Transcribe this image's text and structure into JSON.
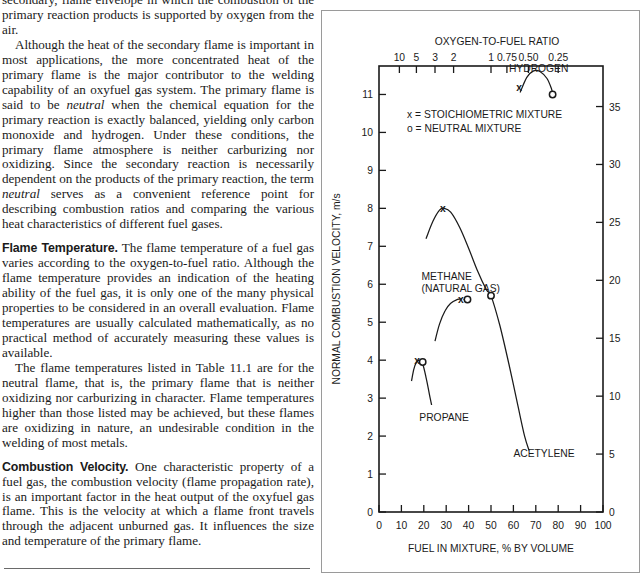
{
  "document": {
    "paragraphs": [
      {
        "id": "p0",
        "indent": false,
        "clipped": true,
        "runs": [
          {
            "t": "text",
            "v": "secondary, flame envelope in which the combustion of the primary reaction products is supported by oxygen from the air."
          }
        ]
      },
      {
        "id": "p1",
        "indent": true,
        "clipped": false,
        "runs": [
          {
            "t": "text",
            "v": "Although the heat of the secondary flame is important in most applications, the more concentrated heat of the primary flame is the major contributor to the welding capability of an oxyfuel gas system. The primary flame is said to be "
          },
          {
            "t": "ital",
            "v": "neutral"
          },
          {
            "t": "text",
            "v": " when the chemical equation for the primary reaction is exactly balanced, yielding only carbon monoxide and hydrogen. Under these conditions, the primary flame atmosphere is neither carburizing nor oxidizing. Since the secondary reaction is necessarily dependent on the products of the primary reaction, the term "
          },
          {
            "t": "ital",
            "v": "neutral"
          },
          {
            "t": "text",
            "v": " serves as a convenient reference point for describing combustion ratios and comparing the various heat characteristics of different fuel gases."
          }
        ]
      },
      {
        "id": "p2",
        "indent": false,
        "clipped": false,
        "runs": [
          {
            "t": "runin",
            "v": "Flame Temperature."
          },
          {
            "t": "text",
            "v": " The flame temperature of a fuel gas varies according to the oxygen-to-fuel ratio. Although the flame temperature provides an indication of the heating ability of the fuel gas, it is only one of the many physical properties to be considered in an overall evaluation. Flame temperatures are usually calculated mathematically, as no practical method of accurately measuring these values is available."
          }
        ]
      },
      {
        "id": "p3",
        "indent": true,
        "clipped": false,
        "runs": [
          {
            "t": "text",
            "v": "The flame temperatures listed in Table 11.1 are for the neutral flame, that is, the primary flame that is neither oxidizing nor carburizing in character. Flame temperatures higher than those listed may be achieved, but these flames are oxidizing in nature, an undesirable condition in the welding of most metals."
          }
        ]
      },
      {
        "id": "p4",
        "indent": false,
        "clipped": false,
        "runs": [
          {
            "t": "runin",
            "v": "Combustion Velocity."
          },
          {
            "t": "text",
            "v": " One characteristic property of a fuel gas, the combustion velocity (flame propagation rate), is an important factor in the heat output of the oxyfuel gas flame. This is the velocity at which a flame front travels through the adjacent unburned gas. It influences the size and temperature of the primary flame."
          }
        ]
      }
    ]
  },
  "chart_data": {
    "type": "line",
    "title": "",
    "xlabel": "FUEL IN MIXTURE, % BY VOLUME",
    "ylabel": "NORMAL COMBUSTION VELOCITY, m/s",
    "y2label": "NORMAL COMBUSTION VELOCITY, ft/s",
    "top_axis_label": "OXYGEN-TO-FUEL RATIO",
    "xlim": [
      0,
      100
    ],
    "ylim": [
      0,
      11.75
    ],
    "y2lim": [
      0,
      38.5
    ],
    "grid": false,
    "legend_position": "inside-top-left",
    "x_ticks": [
      0,
      10,
      20,
      30,
      40,
      50,
      60,
      70,
      80,
      90,
      100
    ],
    "x_tick_labels": [
      "0",
      "10",
      "20",
      "30",
      "40",
      "50",
      "60",
      "70",
      "80",
      "90",
      "100"
    ],
    "y_ticks": [
      0,
      1,
      2,
      3,
      4,
      5,
      6,
      7,
      8,
      9,
      10,
      11
    ],
    "y_tick_labels": [
      "0",
      "1",
      "2",
      "3",
      "4",
      "5",
      "6",
      "7",
      "8",
      "9",
      "10",
      "11"
    ],
    "y2_ticks": [
      0,
      5,
      10,
      15,
      20,
      25,
      30,
      35
    ],
    "y2_tick_labels": [
      "0",
      "5",
      "10",
      "15",
      "20",
      "25",
      "30",
      "35"
    ],
    "top_ticks": [
      {
        "label": "10",
        "x": 9.1
      },
      {
        "label": "5",
        "x": 16.7
      },
      {
        "label": "3",
        "x": 25.0
      },
      {
        "label": "2",
        "x": 33.3
      },
      {
        "label": "1",
        "x": 50.0
      },
      {
        "label": "0.75",
        "x": 57.1
      },
      {
        "label": "0.50",
        "x": 66.7
      },
      {
        "label": "0.25",
        "x": 80.0
      }
    ],
    "legend": [
      {
        "symbol": "x",
        "text": "x = STOICHIOMETRIC MIXTURE"
      },
      {
        "symbol": "o",
        "text": "o = NEUTRAL MIXTURE"
      }
    ],
    "series": [
      {
        "name": "HYDROGEN",
        "label_x": 58,
        "label_y": 11.6,
        "points": [
          [
            63,
            11.05
          ],
          [
            66,
            11.45
          ],
          [
            69,
            11.62
          ],
          [
            72,
            11.6
          ],
          [
            75,
            11.42
          ],
          [
            77,
            11.15
          ],
          [
            77.5,
            11.0
          ]
        ],
        "markers": [
          {
            "type": "x",
            "x": 62.5,
            "y": 11.2
          },
          {
            "type": "o",
            "x": 77.5,
            "y": 11.0
          }
        ]
      },
      {
        "name": "ACETYLENE",
        "label_x": 60,
        "label_y": 1.45,
        "points": [
          [
            21,
            7.2
          ],
          [
            24,
            7.65
          ],
          [
            27,
            7.95
          ],
          [
            29,
            8.0
          ],
          [
            32,
            7.9
          ],
          [
            36,
            7.5
          ],
          [
            40,
            6.95
          ],
          [
            44,
            6.35
          ],
          [
            48,
            5.85
          ],
          [
            50,
            5.7
          ],
          [
            54,
            4.9
          ],
          [
            58,
            3.9
          ],
          [
            62,
            2.8
          ],
          [
            65,
            2.0
          ],
          [
            67,
            1.62
          ]
        ],
        "markers": [
          {
            "type": "x",
            "x": 28.5,
            "y": 8.0
          },
          {
            "type": "o",
            "x": 50,
            "y": 5.7
          }
        ]
      },
      {
        "name": "METHANE (NATURAL GAS)",
        "label_x": 19,
        "label_y": 6.1,
        "points": [
          [
            25,
            4.5
          ],
          [
            27,
            4.95
          ],
          [
            29.5,
            5.3
          ],
          [
            32,
            5.5
          ],
          [
            35,
            5.6
          ],
          [
            37,
            5.62
          ]
        ],
        "markers": [
          {
            "type": "x",
            "x": 36.5,
            "y": 5.6
          },
          {
            "type": "o",
            "x": 39.5,
            "y": 5.6
          }
        ]
      },
      {
        "name": "PROPANE",
        "label_x": 18,
        "label_y": 2.4,
        "points": [
          [
            14.5,
            3.45
          ],
          [
            15.5,
            3.75
          ],
          [
            16.5,
            3.92
          ],
          [
            18,
            4.0
          ],
          [
            19.5,
            3.9
          ],
          [
            21,
            3.55
          ],
          [
            22.5,
            3.1
          ],
          [
            23.5,
            2.82
          ]
        ],
        "markers": [
          {
            "type": "x",
            "x": 17.0,
            "y": 4.0
          },
          {
            "type": "o",
            "x": 19.5,
            "y": 3.95
          }
        ]
      }
    ]
  },
  "colors": {
    "ink": "#1a1a1a",
    "frame": "#9a9a9a",
    "rule": "#6a6a6a"
  }
}
